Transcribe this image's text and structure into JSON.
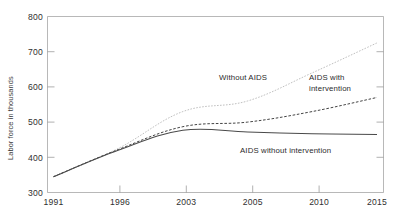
{
  "chart_data": {
    "type": "line",
    "title": "",
    "subtitle": "",
    "xlabel": "",
    "ylabel": "Labor force in thousands",
    "categories": [
      "1991",
      "1996",
      "2003",
      "2005",
      "2010",
      "2015"
    ],
    "xtick_labels": [
      "1991",
      "1996",
      "2003",
      "2005",
      "2010",
      "2015"
    ],
    "ytick_labels": [
      "800",
      "700",
      "600",
      "500",
      "400",
      "300"
    ],
    "ylim": [
      300,
      800
    ],
    "ytick_values": [
      300,
      400,
      500,
      600,
      700,
      800
    ],
    "grid": false,
    "legend_position": "inline-annotations",
    "series": [
      {
        "name": "Without AIDS",
        "style": "dotted-light",
        "color": "#b9b9b9",
        "values": [
          345,
          425,
          530,
          560,
          640,
          725
        ]
      },
      {
        "name": "AIDS with intervention",
        "style": "dashed-dark",
        "color": "#3a3a3a",
        "values": [
          345,
          422,
          487,
          500,
          530,
          570
        ]
      },
      {
        "name": "AIDS without intervention",
        "style": "solid-dark",
        "color": "#4a4a4a",
        "values": [
          345,
          420,
          477,
          472,
          467,
          465
        ]
      }
    ],
    "annotations": [
      {
        "text": "Without AIDS",
        "series": "Without AIDS"
      },
      {
        "text_line1": "AIDS with",
        "text_line2": "intervention",
        "series": "AIDS with intervention"
      },
      {
        "text": "AIDS without intervention",
        "series": "AIDS without intervention"
      }
    ]
  },
  "axes": {
    "y_axis_title": "Labor force in thousands",
    "y_ticks": [
      {
        "label": "800"
      },
      {
        "label": "700"
      },
      {
        "label": "600"
      },
      {
        "label": "500"
      },
      {
        "label": "400"
      },
      {
        "label": "300"
      }
    ],
    "x_ticks": [
      {
        "label": "1991"
      },
      {
        "label": "1996"
      },
      {
        "label": "2003"
      },
      {
        "label": "2005"
      },
      {
        "label": "2010"
      },
      {
        "label": "2015"
      }
    ]
  },
  "annotations": {
    "without_aids": "Without AIDS",
    "aids_with_intervention_line1": "AIDS with",
    "aids_with_intervention_line2": "intervention",
    "aids_without_intervention": "AIDS without intervention"
  },
  "colors": {
    "without_aids": "#b9b9b9",
    "aids_with_intervention": "#3a3a3a",
    "aids_without_intervention": "#4a4a4a",
    "frame": "#9a9a9a",
    "background": "#ffffff"
  }
}
